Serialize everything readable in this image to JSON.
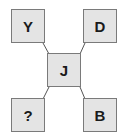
{
  "diagram": {
    "center": {
      "label": "J"
    },
    "corners": {
      "top_left": {
        "label": "Y"
      },
      "top_right": {
        "label": "D"
      },
      "bottom_left": {
        "label": "?"
      },
      "bottom_right": {
        "label": "B"
      }
    }
  },
  "colors": {
    "box_fill": "#e4e4e4",
    "box_border": "#7a7a7a",
    "connector": "#555555",
    "text": "#1a1a1a"
  }
}
